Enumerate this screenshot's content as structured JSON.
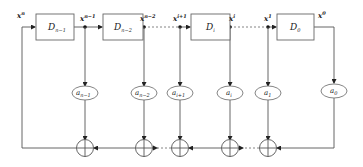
{
  "diagram": {
    "type": "shift-register-feedback",
    "delay_blocks": [
      {
        "id": "d_n_minus_1",
        "label": "D",
        "sub": "n−1"
      },
      {
        "id": "d_n_minus_2",
        "label": "D",
        "sub": "n−2"
      },
      {
        "id": "d_i",
        "label": "D",
        "sub": "i"
      },
      {
        "id": "d_0",
        "label": "D",
        "sub": "0"
      }
    ],
    "signals": [
      {
        "id": "x_n",
        "base": "x",
        "sup": "n"
      },
      {
        "id": "x_n_minus_1",
        "base": "x",
        "sup": "n−1"
      },
      {
        "id": "x_n_minus_2",
        "base": "x",
        "sup": "n−2"
      },
      {
        "id": "x_i_plus_1",
        "base": "x",
        "sup": "i+1"
      },
      {
        "id": "x_i",
        "base": "x",
        "sup": "i"
      },
      {
        "id": "x_1",
        "base": "x",
        "sup": "1"
      },
      {
        "id": "x_0",
        "base": "x",
        "sup": "0"
      }
    ],
    "coefficients": [
      {
        "id": "a_n_minus_1",
        "base": "a",
        "sub": "n−1"
      },
      {
        "id": "a_n_minus_2",
        "base": "a",
        "sub": "n−2"
      },
      {
        "id": "a_i_plus_1",
        "base": "a",
        "sub": "i+1"
      },
      {
        "id": "a_i",
        "base": "a",
        "sub": "i"
      },
      {
        "id": "a_1",
        "base": "a",
        "sub": "1"
      },
      {
        "id": "a_0",
        "base": "a",
        "sub": "0"
      }
    ],
    "adders_count": 5,
    "colors": {
      "line": "#555555",
      "box_border": "#666666",
      "text": "#222222",
      "background": "#ffffff"
    }
  }
}
